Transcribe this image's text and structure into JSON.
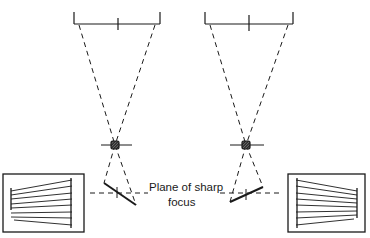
{
  "diagram": {
    "caption_line1": "Plane of sharp",
    "caption_line2": "focus",
    "ink_color": "#1a1a1a",
    "background": "#ffffff",
    "panels": [
      {
        "side": "left",
        "film_holder": {
          "x1": 74,
          "x2": 160,
          "y": 24,
          "tick_top": 12,
          "center_x": 118
        },
        "lens": {
          "cx": 115,
          "cy": 145
        },
        "subject_plane": {
          "x1": 104,
          "y1": 183,
          "x2": 136,
          "y2": 205
        },
        "inset": {
          "x": 3,
          "y": 174,
          "w": 81,
          "h": 58,
          "lines_converge": "right"
        }
      },
      {
        "side": "right",
        "film_holder": {
          "x1": 205,
          "x2": 293,
          "y": 24,
          "tick_top": 12,
          "center_x": 249
        },
        "lens": {
          "cx": 246,
          "cy": 145
        },
        "subject_plane": {
          "x1": 230,
          "y1": 202,
          "x2": 263,
          "y2": 187
        },
        "inset": {
          "x": 288,
          "y": 174,
          "w": 77,
          "h": 58,
          "lines_converge": "right"
        }
      }
    ],
    "focus_plane_y": 193
  }
}
